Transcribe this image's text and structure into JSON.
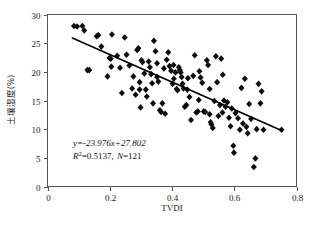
{
  "chart_data": {
    "type": "scatter",
    "title": "",
    "xlabel": "TVDI",
    "ylabel": "土壤湿度(%)",
    "xlim": [
      0,
      0.8
    ],
    "ylim": [
      0,
      30
    ],
    "xticks": [
      "0",
      "0.2",
      "0.4",
      "0.6",
      "0.8"
    ],
    "xtick_values": [
      0,
      0.2,
      0.4,
      0.6,
      0.8
    ],
    "yticks": [
      "0",
      "5",
      "10",
      "15",
      "20",
      "25",
      "30"
    ],
    "ytick_values": [
      0,
      5,
      10,
      15,
      20,
      25,
      30
    ],
    "grid": false,
    "legend": "none",
    "marker": "diamond",
    "marker_color": "#0d0d0d",
    "line_color": "#000000",
    "annotations": {
      "equation": "y=-23.976x+27.802",
      "equation_slope": -23.976,
      "equation_intercept": 27.802,
      "r_squared_label": "R",
      "r_squared_exponent": "2",
      "r_squared_text": "=0.5137,",
      "n_label": "N",
      "n_text": "=121",
      "r_squared": 0.5137,
      "n": 121
    },
    "fit_line": {
      "x": [
        0.08,
        0.75
      ],
      "y": [
        25.884,
        9.81
      ]
    },
    "points": [
      [
        0.085,
        28.0
      ],
      [
        0.095,
        27.9
      ],
      [
        0.112,
        28.0
      ],
      [
        0.118,
        27.2
      ],
      [
        0.128,
        20.3
      ],
      [
        0.134,
        20.3
      ],
      [
        0.158,
        26.2
      ],
      [
        0.163,
        26.4
      ],
      [
        0.173,
        24.4
      ],
      [
        0.193,
        19.2
      ],
      [
        0.199,
        22.4
      ],
      [
        0.203,
        22.3
      ],
      [
        0.207,
        26.5
      ],
      [
        0.224,
        22.8
      ],
      [
        0.233,
        20.7
      ],
      [
        0.239,
        16.3
      ],
      [
        0.248,
        26.0
      ],
      [
        0.254,
        23.0
      ],
      [
        0.263,
        21.1
      ],
      [
        0.272,
        17.1
      ],
      [
        0.276,
        19.2
      ],
      [
        0.283,
        16.0
      ],
      [
        0.288,
        23.8
      ],
      [
        0.292,
        24.1
      ],
      [
        0.296,
        16.9
      ],
      [
        0.299,
        13.8
      ],
      [
        0.302,
        22.0
      ],
      [
        0.305,
        21.7
      ],
      [
        0.311,
        19.7
      ],
      [
        0.316,
        16.9
      ],
      [
        0.319,
        15.7
      ],
      [
        0.325,
        21.8
      ],
      [
        0.329,
        20.8
      ],
      [
        0.333,
        19.6
      ],
      [
        0.336,
        18.0
      ],
      [
        0.339,
        14.5
      ],
      [
        0.342,
        25.4
      ],
      [
        0.347,
        23.6
      ],
      [
        0.352,
        21.5
      ],
      [
        0.356,
        18.3
      ],
      [
        0.361,
        13.3
      ],
      [
        0.365,
        13.0
      ],
      [
        0.369,
        14.5
      ],
      [
        0.374,
        20.6
      ],
      [
        0.378,
        12.7
      ],
      [
        0.383,
        22.1
      ],
      [
        0.388,
        23.4
      ],
      [
        0.392,
        21.0
      ],
      [
        0.397,
        20.2
      ],
      [
        0.402,
        17.9
      ],
      [
        0.406,
        18.8
      ],
      [
        0.411,
        19.9
      ],
      [
        0.415,
        17.0
      ],
      [
        0.418,
        16.8
      ],
      [
        0.422,
        20.8
      ],
      [
        0.425,
        20.3
      ],
      [
        0.428,
        19.9
      ],
      [
        0.431,
        19.1
      ],
      [
        0.434,
        17.9
      ],
      [
        0.437,
        17.1
      ],
      [
        0.441,
        13.9
      ],
      [
        0.446,
        14.2
      ],
      [
        0.451,
        18.9
      ],
      [
        0.456,
        15.6
      ],
      [
        0.461,
        11.6
      ],
      [
        0.468,
        19.3
      ],
      [
        0.473,
        22.9
      ],
      [
        0.478,
        12.9
      ],
      [
        0.483,
        13.1
      ],
      [
        0.488,
        20.1
      ],
      [
        0.492,
        19.0
      ],
      [
        0.497,
        18.1
      ],
      [
        0.502,
        13.1
      ],
      [
        0.507,
        13.0
      ],
      [
        0.512,
        22.0
      ],
      [
        0.516,
        21.2
      ],
      [
        0.521,
        12.6
      ],
      [
        0.524,
        11.2
      ],
      [
        0.527,
        10.8
      ],
      [
        0.531,
        10.2
      ],
      [
        0.536,
        14.9
      ],
      [
        0.541,
        22.7
      ],
      [
        0.545,
        18.2
      ],
      [
        0.549,
        12.3
      ],
      [
        0.554,
        14.2
      ],
      [
        0.558,
        22.3
      ],
      [
        0.563,
        19.5
      ],
      [
        0.567,
        15.0
      ],
      [
        0.572,
        13.9
      ],
      [
        0.578,
        14.7
      ],
      [
        0.583,
        12.0
      ],
      [
        0.588,
        10.5
      ],
      [
        0.592,
        13.6
      ],
      [
        0.597,
        7.1
      ],
      [
        0.599,
        5.9
      ],
      [
        0.604,
        12.8
      ],
      [
        0.612,
        11.9
      ],
      [
        0.618,
        9.9
      ],
      [
        0.623,
        17.2
      ],
      [
        0.628,
        11.0
      ],
      [
        0.634,
        18.8
      ],
      [
        0.639,
        10.4
      ],
      [
        0.643,
        9.3
      ],
      [
        0.648,
        14.4
      ],
      [
        0.654,
        11.8
      ],
      [
        0.663,
        3.4
      ],
      [
        0.668,
        4.9
      ],
      [
        0.672,
        10.0
      ],
      [
        0.678,
        17.9
      ],
      [
        0.684,
        14.5
      ],
      [
        0.688,
        16.6
      ],
      [
        0.694,
        9.9
      ],
      [
        0.752,
        9.9
      ],
      [
        0.296,
        18.2
      ],
      [
        0.352,
        19.1
      ],
      [
        0.405,
        21.2
      ],
      [
        0.449,
        16.9
      ],
      [
        0.486,
        15.1
      ],
      [
        0.521,
        17.0
      ],
      [
        0.562,
        12.9
      ],
      [
        0.205,
        20.9
      ]
    ]
  }
}
